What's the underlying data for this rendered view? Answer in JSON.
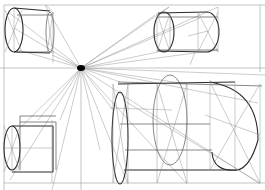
{
  "diagram": {
    "title": "",
    "vanishing_point": {
      "x": 81,
      "y": 68
    },
    "horizon_y": 68,
    "colors": {
      "ink": "#2a2a2a",
      "construction": "#8c8c8c",
      "background": "#ffffff"
    },
    "objects": [
      {
        "id": "cylinder-top-left",
        "label": ""
      },
      {
        "id": "cylinder-top-right",
        "label": ""
      },
      {
        "id": "cylinder-bottom-left",
        "label": ""
      },
      {
        "id": "cylinder-bottom-right-large",
        "label": ""
      }
    ]
  }
}
